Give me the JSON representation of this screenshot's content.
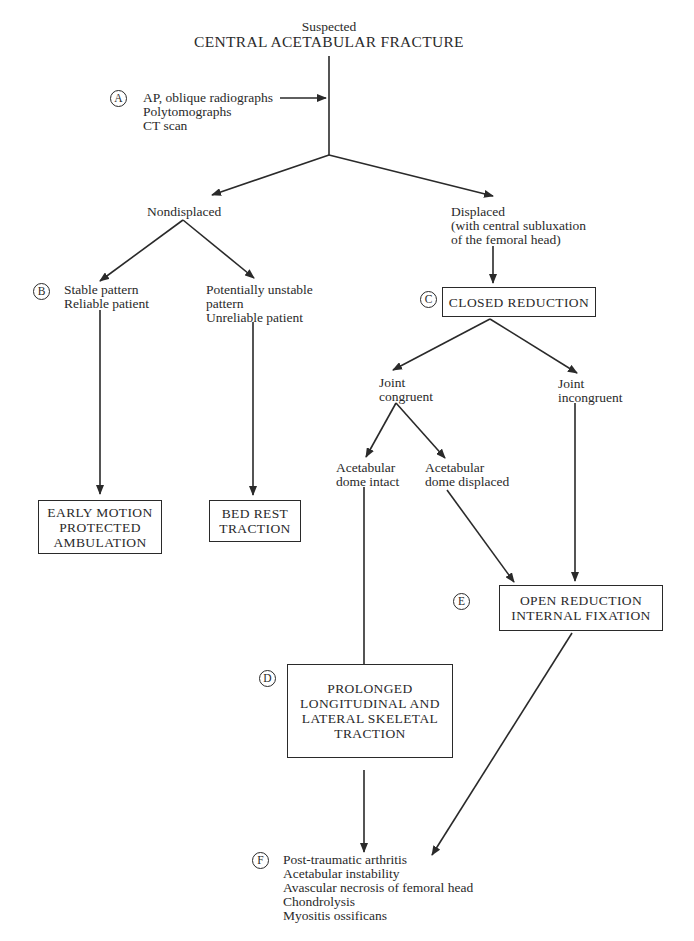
{
  "title": {
    "line1": "Suspected",
    "line2": "CENTRAL ACETABULAR FRACTURE"
  },
  "labels": {
    "A": "A",
    "B": "B",
    "C": "C",
    "D": "D",
    "E": "E",
    "F": "F"
  },
  "nodes": {
    "imaging": "AP, oblique radiographs\nPolytomographs\nCT scan",
    "nondisplaced": "Nondisplaced",
    "displaced": "Displaced\n(with central subluxation\nof the femoral head)",
    "stable": "Stable pattern\nReliable patient",
    "unstable": "Potentially unstable\npattern\nUnreliable patient",
    "closed_reduction": "CLOSED REDUCTION",
    "joint_congruent": "Joint\ncongruent",
    "joint_incongruent": "Joint\nincongruent",
    "dome_intact": "Acetabular\ndome intact",
    "dome_displaced": "Acetabular\ndome displaced",
    "early_motion": "EARLY MOTION\nPROTECTED\nAMBULATION",
    "bed_rest": "BED REST\nTRACTION",
    "orif": "OPEN REDUCTION\nINTERNAL FIXATION",
    "prolonged_traction": "PROLONGED\nLONGITUDINAL AND\nLATERAL SKELETAL\nTRACTION",
    "complications": "Post-traumatic arthritis\nAcetabular instability\nAvascular necrosis of femoral head\nChondrolysis\nMyositis ossificans"
  },
  "colors": {
    "ink": "#2a2a2a",
    "background": "#ffffff"
  }
}
